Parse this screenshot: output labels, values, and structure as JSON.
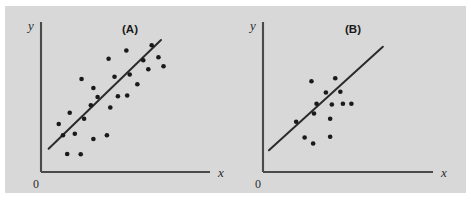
{
  "figure": {
    "background_color": "#ffffff",
    "panel_color": "#d8d8d8",
    "axis_color": "#4a4a4a",
    "line_color": "#2b2b2b",
    "point_color": "#1a1a1a"
  },
  "panels": {
    "a": {
      "label": "(A)",
      "xlabel": "x",
      "ylabel": "y",
      "origin_label": "0"
    },
    "b": {
      "label": "(B)",
      "xlabel": "x",
      "ylabel": "y",
      "origin_label": "0"
    }
  },
  "chart_data": [
    {
      "type": "scatter",
      "title": "(A)",
      "xlabel": "x",
      "ylabel": "y",
      "xlim": [
        0,
        10
      ],
      "ylim": [
        0,
        10
      ],
      "grid": false,
      "legend": "none",
      "annotations": [
        "0"
      ],
      "description": "Scatter of points with moderate positive linear association and a fitted straight line of best fit; points scatter widely about the line.",
      "points": [
        {
          "x": 1.55,
          "y": 1.2
        },
        {
          "x": 2.35,
          "y": 1.18
        },
        {
          "x": 1.3,
          "y": 2.45
        },
        {
          "x": 2.0,
          "y": 2.55
        },
        {
          "x": 1.05,
          "y": 3.2
        },
        {
          "x": 1.7,
          "y": 3.95
        },
        {
          "x": 3.1,
          "y": 2.2
        },
        {
          "x": 3.9,
          "y": 2.45
        },
        {
          "x": 2.55,
          "y": 3.55
        },
        {
          "x": 2.95,
          "y": 4.45
        },
        {
          "x": 3.35,
          "y": 5.0
        },
        {
          "x": 3.1,
          "y": 5.6
        },
        {
          "x": 4.1,
          "y": 4.3
        },
        {
          "x": 4.55,
          "y": 5.05
        },
        {
          "x": 5.1,
          "y": 5.1
        },
        {
          "x": 2.4,
          "y": 6.2
        },
        {
          "x": 4.35,
          "y": 6.35
        },
        {
          "x": 5.7,
          "y": 5.85
        },
        {
          "x": 5.25,
          "y": 6.5
        },
        {
          "x": 4.0,
          "y": 7.55
        },
        {
          "x": 5.05,
          "y": 8.1
        },
        {
          "x": 6.05,
          "y": 7.45
        },
        {
          "x": 6.35,
          "y": 6.85
        },
        {
          "x": 6.55,
          "y": 8.45
        },
        {
          "x": 6.95,
          "y": 7.65
        },
        {
          "x": 7.25,
          "y": 7.05
        }
      ],
      "fit_line": {
        "x0": 0.45,
        "y0": 1.55,
        "x1": 7.1,
        "y1": 8.8
      }
    },
    {
      "type": "scatter",
      "title": "(B)",
      "xlabel": "x",
      "ylabel": "y",
      "xlim": [
        0,
        10
      ],
      "ylim": [
        0,
        10
      ],
      "grid": false,
      "legend": "none",
      "annotations": [
        "0"
      ],
      "description": "Scatter of fewer points clustered tightly about a fitted straight line, showing a stronger positive linear association than panel (A).",
      "points": [
        {
          "x": 2.45,
          "y": 2.3
        },
        {
          "x": 2.95,
          "y": 1.9
        },
        {
          "x": 3.95,
          "y": 2.35
        },
        {
          "x": 1.95,
          "y": 3.35
        },
        {
          "x": 3.0,
          "y": 3.9
        },
        {
          "x": 3.95,
          "y": 3.55
        },
        {
          "x": 3.15,
          "y": 4.55
        },
        {
          "x": 4.05,
          "y": 4.5
        },
        {
          "x": 4.7,
          "y": 4.55
        },
        {
          "x": 5.2,
          "y": 4.55
        },
        {
          "x": 3.7,
          "y": 5.3
        },
        {
          "x": 4.55,
          "y": 5.35
        },
        {
          "x": 2.85,
          "y": 6.05
        },
        {
          "x": 4.25,
          "y": 6.25
        }
      ],
      "fit_line": {
        "x0": 0.35,
        "y0": 1.45,
        "x1": 7.05,
        "y1": 8.35
      }
    }
  ]
}
